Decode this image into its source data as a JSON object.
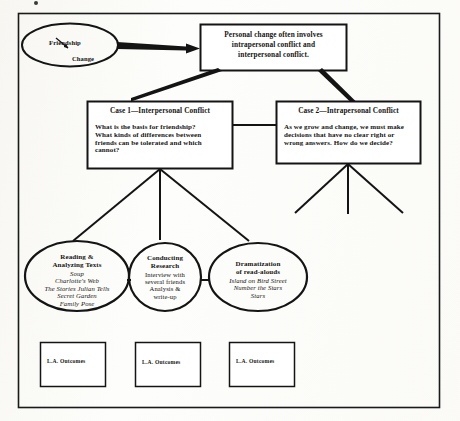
{
  "diagram": {
    "frame": {
      "name": "outer-frame"
    },
    "seed_ellipse": {
      "label_top": "Friendship",
      "label_bottom": "Change"
    },
    "thesis_box": {
      "line1": "Personal change often involves",
      "line2": "intrapersonal conflict and",
      "line3": "interpersonal conflict."
    },
    "cases": [
      {
        "title": "Case 1—Interpersonal Conflict",
        "body_lines": [
          "What is the basis for friendship?",
          "What kinds of differences between",
          "friends can be tolerated and which",
          "cannot?"
        ]
      },
      {
        "title": "Case 2—Intrapersonal Conflict",
        "body_lines": [
          "As we grow and change, we must make",
          "decisions that have no clear right or",
          "wrong answers.  How do we decide?"
        ]
      }
    ],
    "activities": [
      {
        "heading_lines": [
          "Reading &",
          "Analyzing Texts"
        ],
        "items": [
          "Soup",
          "Charlotte's Web",
          "The Stories Julian Tells",
          "Secret Garden",
          "Family Pose"
        ],
        "items_style": "italic"
      },
      {
        "heading_lines": [
          "Conducting",
          "Research"
        ],
        "items": [
          "Interview with",
          "several friends",
          "Analysis &",
          "write-up"
        ],
        "items_style": "plain"
      },
      {
        "heading_lines": [
          "Dramatization",
          "of read-alouds"
        ],
        "items": [
          "Island on Bird Street",
          "Number the Stars",
          "Stars"
        ],
        "items_style": "italic"
      }
    ],
    "outcome_boxes": [
      {
        "label": "L.A. Outcomes"
      },
      {
        "label": "L.A. Outcomes"
      },
      {
        "label": "L.A. Outcomes"
      }
    ],
    "colors": {
      "ink": "#141414",
      "paper": "#fdfdfb",
      "frame": "#1a1a1a"
    }
  }
}
